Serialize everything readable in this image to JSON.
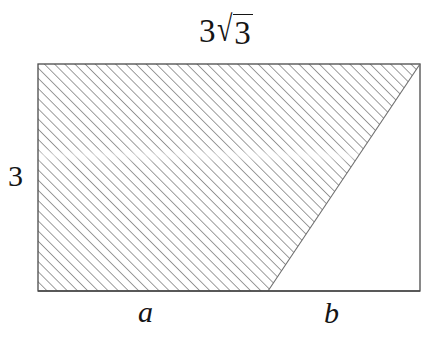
{
  "figure": {
    "title_label": "3√3",
    "background_color": "#ffffff",
    "stroke_color": "#4a4a4a",
    "hatch_color": "#8c8c8c",
    "text_color": "#151515",
    "labels": {
      "top": {
        "name": "top-side-length",
        "coefficient": "3",
        "radical_symbol": "√",
        "radicand": "3",
        "full": "3√3"
      },
      "left": {
        "name": "left-side-length",
        "text": "3"
      },
      "bottom_left": {
        "name": "segment-a",
        "text": "a"
      },
      "bottom_right": {
        "name": "segment-b",
        "text": "b"
      }
    },
    "geometry": {
      "rectangle": {
        "x": 38,
        "y": 64,
        "width": 382,
        "height": 227
      },
      "hatched_polygon": [
        [
          38,
          64
        ],
        [
          420,
          64
        ],
        [
          268,
          291
        ],
        [
          38,
          291
        ]
      ],
      "diagonal_line": {
        "x1": 268,
        "y1": 291,
        "x2": 420,
        "y2": 64
      },
      "bottom_split_x": 268,
      "hatch_angle_degrees": 45,
      "hatch_spacing_px": 7.2
    }
  }
}
